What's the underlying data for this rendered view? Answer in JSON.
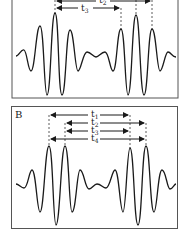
{
  "panels": [
    {
      "id": "A",
      "label": "",
      "intervals": [
        {
          "name": "t",
          "sub": "2",
          "from_x": 55,
          "to_x": 152,
          "y": 1
        },
        {
          "name": "t",
          "sub": "3",
          "from_x": 55,
          "to_x": 121,
          "y": 8
        }
      ]
    },
    {
      "id": "B",
      "label": "B",
      "intervals": [
        {
          "name": "t",
          "sub": "1",
          "from_x": 49,
          "to_x": 130,
          "y": 115
        },
        {
          "name": "t",
          "sub": "2",
          "from_x": 65,
          "to_x": 146,
          "y": 123
        },
        {
          "name": "t",
          "sub": "3",
          "from_x": 65,
          "to_x": 130,
          "y": 131
        },
        {
          "name": "t",
          "sub": "4",
          "from_x": 49,
          "to_x": 146,
          "y": 139
        }
      ]
    }
  ],
  "labels": {
    "a_t2": "t",
    "a_t2_sub": "2",
    "a_t3": "t",
    "a_t3_sub": "3",
    "b_panel": "B",
    "b_t1": "t",
    "b_t1_sub": "1",
    "b_t2": "t",
    "b_t2_sub": "2",
    "b_t3": "t",
    "b_t3_sub": "3",
    "b_t4": "t",
    "b_t4_sub": "4"
  },
  "colors": {
    "stroke": "#1a1a1a",
    "frame": "#555555",
    "background": "#ffffff"
  }
}
